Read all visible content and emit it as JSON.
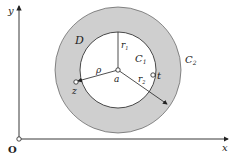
{
  "diagram": {
    "axes": {
      "x_label": "x",
      "y_label": "y",
      "origin_label": "O"
    },
    "region_label": "D",
    "inner_circle_label": "C",
    "inner_circle_sub": "1",
    "outer_circle_label": "C",
    "outer_circle_sub": "2",
    "center_label": "a",
    "point_z_label": "z",
    "point_t_label": "t",
    "rho_label": "ρ",
    "r1_label": "r",
    "r1_sub": "1",
    "r2_label": "r",
    "r2_sub": "2",
    "colors": {
      "annulus": "#cfcfcf",
      "stroke": "#222222"
    }
  }
}
